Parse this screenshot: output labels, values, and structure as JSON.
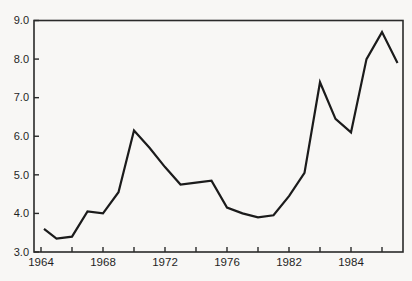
{
  "page": {
    "background": "#f8f7f5"
  },
  "chart_data": {
    "type": "line",
    "title": "",
    "xlabel": "",
    "ylabel": "",
    "grid": false,
    "legend": false,
    "frame": "full-box",
    "line_color": "#1b1b1b",
    "axis_color": "#2a2a2a",
    "text_color": "#1f1f1f",
    "x": [
      1964,
      1965,
      1966,
      1967,
      1968,
      1969,
      1970,
      1971,
      1972,
      1973,
      1974,
      1975,
      1976,
      1977,
      1978,
      1979,
      1980,
      1981,
      1982,
      1983,
      1984,
      1985,
      1986,
      1987
    ],
    "values": [
      3.6,
      3.35,
      3.4,
      4.05,
      4.0,
      4.55,
      6.15,
      5.7,
      5.2,
      4.75,
      4.8,
      4.85,
      4.15,
      4.0,
      3.9,
      3.95,
      4.45,
      5.05,
      7.4,
      6.45,
      6.1,
      8.0,
      8.7,
      7.9
    ],
    "ylim": [
      3.0,
      9.0
    ],
    "y_ticks": [
      3.0,
      4.0,
      5.0,
      6.0,
      7.0,
      8.0,
      9.0
    ],
    "y_tick_labels": [
      "3.0",
      "4.0",
      "5.0",
      "6.0",
      "7.0",
      "8.0",
      "9.0"
    ],
    "x_ticks": [
      1964,
      1966,
      1968,
      1970,
      1972,
      1974,
      1976,
      1978,
      1980,
      1982,
      1984,
      1986
    ],
    "x_tick_labels": [
      {
        "year": 1964,
        "text": "1964"
      },
      {
        "year": 1968,
        "text": "1968"
      },
      {
        "year": 1972,
        "text": "1972"
      },
      {
        "year": 1976,
        "text": "1976"
      },
      {
        "year": 1980,
        "text": "1982"
      },
      {
        "year": 1984,
        "text": "1984"
      }
    ]
  }
}
